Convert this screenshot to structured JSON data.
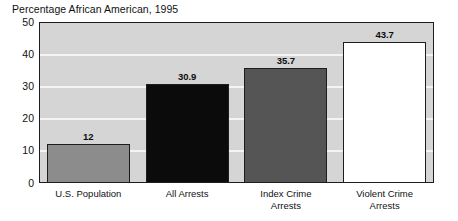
{
  "chart_data": {
    "type": "bar",
    "title": "Percentage African American, 1995",
    "xlabel": "",
    "ylabel": "",
    "ylim": [
      0,
      50
    ],
    "ytick_step": 10,
    "ytick_labels": [
      "50",
      "40",
      "30",
      "20",
      "10",
      "0"
    ],
    "ytick_values": [
      50,
      40,
      30,
      20,
      10,
      0
    ],
    "gridlines": [
      40,
      30,
      20,
      10
    ],
    "grid": true,
    "legend": "none",
    "categories": [
      "U.S. Population",
      "All Arrests",
      "Index Crime Arrests",
      "Violent Crime Arrests"
    ],
    "category_lines": [
      [
        "U.S. Population"
      ],
      [
        "All Arrests"
      ],
      [
        "Index Crime",
        "Arrests"
      ],
      [
        "Violent Crime",
        "Arrests"
      ]
    ],
    "values": [
      12,
      30.9,
      35.7,
      43.7
    ],
    "value_labels": [
      "12",
      "30.9",
      "35.7",
      "43.7"
    ],
    "bar_colors": [
      "#8c8c8c",
      "#0b0b0b",
      "#555555",
      "#ffffff"
    ],
    "plot_background": "#d5d5d5",
    "gridline_color": "#f4f4f4",
    "axis_color": "#1d1d1d",
    "text_color": "#111111"
  }
}
